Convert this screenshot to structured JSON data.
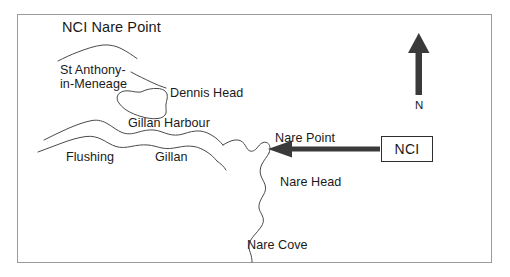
{
  "figure": {
    "title": "NCI Nare Point",
    "kind": "coastline-location-map"
  },
  "frame": {
    "border_color": "#9a9a9a"
  },
  "colors": {
    "coastline": "#4a4a4a",
    "arrow": "#3a3a3a",
    "compass": "#3a3a3a",
    "text": "#1a1a1a",
    "background": "#ffffff",
    "box_border": "#2e2e2e"
  },
  "labels": {
    "st_anthony": "St Anthony-\nin-Meneage",
    "dennis_head": "Dennis Head",
    "gillan_harbour": "Gillan Harbour",
    "flushing": "Flushing",
    "gillan": "Gillan",
    "nare_point": "Nare Point",
    "nare_head": "Nare Head",
    "nare_cove": "Nare Cove"
  },
  "compass": {
    "direction_letter": "N",
    "points_to": "up"
  },
  "callout": {
    "box_label": "NCI",
    "arrow_direction": "left",
    "arrow_target": "Nare Point"
  }
}
